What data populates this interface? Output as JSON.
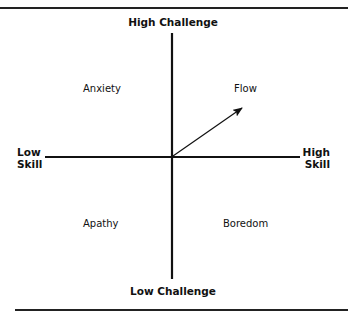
{
  "diagram": {
    "type": "quadrant-diagram",
    "axes": {
      "vertical": {
        "top_label": "High Challenge",
        "bottom_label": "Low Challenge"
      },
      "horizontal": {
        "left_label_line1": "Low",
        "left_label_line2": "Skill",
        "right_label_line1": "High",
        "right_label_line2": "Skill"
      }
    },
    "quadrants": {
      "top_left": "Anxiety",
      "top_right": "Flow",
      "bottom_left": "Apathy",
      "bottom_right": "Boredom"
    },
    "arrow": {
      "from": "origin",
      "to": "Flow",
      "direction": "up-right"
    },
    "colors": {
      "line": "#111111",
      "background": "#ffffff"
    }
  }
}
